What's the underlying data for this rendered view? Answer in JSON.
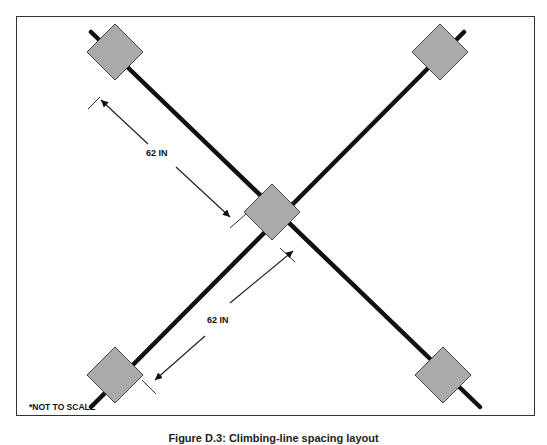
{
  "figure": {
    "note": "*NOT TO SCALE",
    "caption": "Figure D.3: Climbing-line spacing layout",
    "dimensions": [
      {
        "label": "62 IN",
        "from": "top-left weight",
        "to": "center weight"
      },
      {
        "label": "62 IN",
        "from": "center weight",
        "to": "bottom-left weight"
      }
    ],
    "nodes": [
      "top-left",
      "top-right",
      "center",
      "bottom-left",
      "bottom-right"
    ],
    "colors": {
      "node_fill": "#aaaaaa",
      "line": "#111111",
      "frame": "#333333"
    }
  }
}
